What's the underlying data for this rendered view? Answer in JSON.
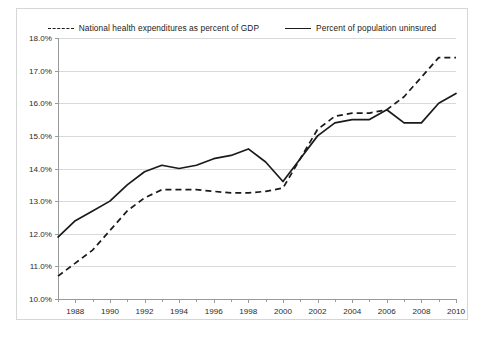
{
  "legend": {
    "entries": [
      {
        "label": "National health expenditures as percent of GDP",
        "style": "dashed",
        "swatch_name": "legend-swatch-dashed"
      },
      {
        "label": "Percent of population uninsured",
        "style": "solid",
        "swatch_name": "legend-swatch-solid"
      }
    ]
  },
  "chart_data": {
    "type": "line",
    "title": "",
    "xlabel": "",
    "ylabel": "",
    "xlim": [
      1987,
      2010
    ],
    "ylim": [
      10.0,
      18.0
    ],
    "grid": true,
    "legend_position": "top",
    "y_tick_labels": [
      "10.0%",
      "11.0%",
      "12.0%",
      "13.0%",
      "14.0%",
      "15.0%",
      "16.0%",
      "17.0%",
      "18.0%"
    ],
    "y_ticks": [
      10.0,
      11.0,
      12.0,
      13.0,
      14.0,
      15.0,
      16.0,
      17.0,
      18.0
    ],
    "x_tick_labels": [
      "1988",
      "1990",
      "1992",
      "1994",
      "1996",
      "1998",
      "2000",
      "2002",
      "2004",
      "2006",
      "2008",
      "2010"
    ],
    "x_ticks": [
      1988,
      1990,
      1992,
      1994,
      1996,
      1998,
      2000,
      2002,
      2004,
      2006,
      2008,
      2010
    ],
    "x_minor_ticks": [
      1987,
      1989,
      1991,
      1993,
      1995,
      1997,
      1999,
      2001,
      2003,
      2005,
      2007,
      2009
    ],
    "x": [
      1987,
      1988,
      1989,
      1990,
      1991,
      1992,
      1993,
      1994,
      1995,
      1996,
      1997,
      1998,
      1999,
      2000,
      2001,
      2002,
      2003,
      2004,
      2005,
      2006,
      2007,
      2008,
      2009,
      2010
    ],
    "series": [
      {
        "name": "National health expenditures as percent of GDP",
        "style": "dashed",
        "color": "#1a1a1a",
        "values": [
          10.7,
          11.1,
          11.5,
          12.1,
          12.7,
          13.1,
          13.35,
          13.35,
          13.35,
          13.3,
          13.25,
          13.25,
          13.3,
          13.4,
          14.3,
          15.2,
          15.6,
          15.7,
          15.7,
          15.8,
          16.2,
          16.8,
          17.4,
          17.4
        ]
      },
      {
        "name": "Percent of population uninsured",
        "style": "solid",
        "color": "#1a1a1a",
        "values": [
          11.9,
          12.4,
          12.7,
          13.0,
          13.5,
          13.9,
          14.1,
          14.0,
          14.1,
          14.3,
          14.4,
          14.6,
          14.2,
          13.6,
          14.3,
          15.0,
          15.4,
          15.5,
          15.5,
          15.8,
          15.4,
          15.4,
          16.0,
          16.3
        ]
      }
    ]
  }
}
